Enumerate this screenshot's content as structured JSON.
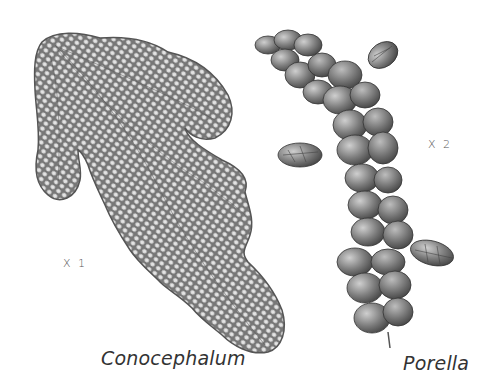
{
  "plate": {
    "background": "#ffffff",
    "specimens": [
      {
        "name": "Conocephalum",
        "magnification": "X 1",
        "form": "thalloid",
        "fill_color": "#7a7a7a",
        "cell_color": "#e6e6e6"
      },
      {
        "name": "Porella",
        "magnification": "X 2",
        "form": "leafy",
        "fill_color": "#6b6b6b",
        "highlight_color": "#c9c9c9"
      }
    ]
  }
}
